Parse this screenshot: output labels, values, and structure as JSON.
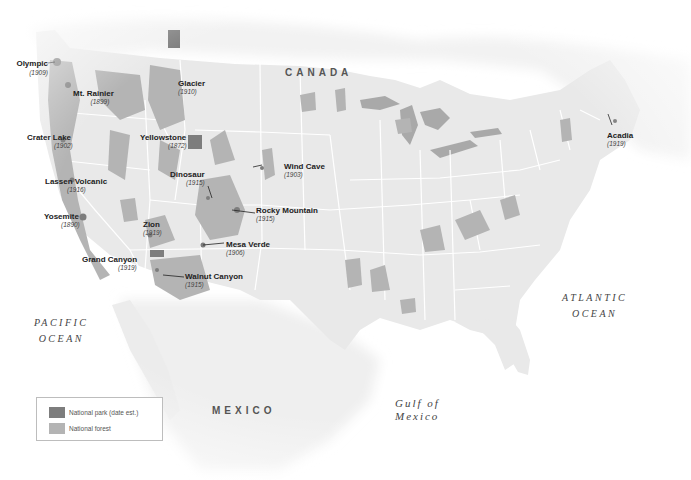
{
  "map": {
    "colors": {
      "land": "#ececec",
      "canada": "#f1f1f1",
      "border": "#ffffff",
      "national_forest": "#b4b4b4",
      "national_park": "#7d7d7d",
      "water": "#ffffff",
      "lakes": "#a8a8a8"
    },
    "countries": {
      "canada": "CANADA",
      "mexico": "MEXICO"
    },
    "water_bodies": {
      "pacific_line1": "PACIFIC",
      "pacific_line2": "OCEAN",
      "atlantic_line1": "ATLANTIC",
      "atlantic_line2": "OCEAN",
      "gulf_line1": "Gulf of",
      "gulf_line2": "Mexico"
    },
    "parks": [
      {
        "name": "Olympic",
        "year": "(1909)"
      },
      {
        "name": "Mt. Rainier",
        "year": "(1899)"
      },
      {
        "name": "Crater Lake",
        "year": "(1902)"
      },
      {
        "name": "Lassen Volcanic",
        "year": "(1916)"
      },
      {
        "name": "Yosemite",
        "year": "(1890)"
      },
      {
        "name": "Glacier",
        "year": "(1910)"
      },
      {
        "name": "Yellowstone",
        "year": "(1872)"
      },
      {
        "name": "Dinosaur",
        "year": "(1915)"
      },
      {
        "name": "Wind Cave",
        "year": "(1903)"
      },
      {
        "name": "Rocky Mountain",
        "year": "(1915)"
      },
      {
        "name": "Zion",
        "year": "(1919)"
      },
      {
        "name": "Mesa Verde",
        "year": "(1906)"
      },
      {
        "name": "Grand Canyon",
        "year": "(1919)"
      },
      {
        "name": "Walnut Canyon",
        "year": "(1915)"
      },
      {
        "name": "Acadia",
        "year": "(1919)"
      }
    ]
  },
  "legend": {
    "items": [
      {
        "label": "National park (date est.)",
        "color": "#7d7d7d"
      },
      {
        "label": "National forest",
        "color": "#b4b4b4"
      }
    ]
  }
}
